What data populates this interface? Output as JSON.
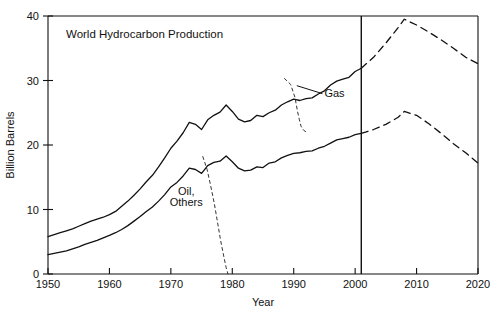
{
  "chart_data": {
    "type": "line",
    "title": "World Hydrocarbon Production",
    "xlabel": "Year",
    "ylabel": "Billion Barrels",
    "xlim": [
      1950,
      2020
    ],
    "ylim": [
      0,
      40
    ],
    "xticks": [
      1950,
      1960,
      1970,
      1980,
      1990,
      2000,
      2010,
      2020
    ],
    "xticklabels": [
      "1950",
      "1960",
      "1970",
      "1980",
      "1990",
      "2000",
      "2010",
      "2020"
    ],
    "yticks": [
      0,
      10,
      20,
      30,
      40
    ],
    "yticklabels": [
      "0",
      "10",
      "20",
      "30",
      "40"
    ],
    "grid": false,
    "legend_position": "inline-annotations",
    "annotations": [
      {
        "text": "Gas",
        "x": 1995,
        "y": 27.5,
        "leader_to": {
          "x": 1990.5,
          "y": 29.2
        }
      },
      {
        "text": "Oil,",
        "x": 1972.5,
        "y": 12.2
      },
      {
        "text": "Others",
        "x": 1972.5,
        "y": 10.5
      }
    ],
    "vertical_marker": {
      "x": 2001,
      "label": "",
      "from_y": 0,
      "to_y": 40
    },
    "series": [
      {
        "name": "Total (Oil + Gas + Others) - historical",
        "style": "solid",
        "x": [
          1950,
          1951,
          1952,
          1953,
          1954,
          1955,
          1956,
          1957,
          1958,
          1959,
          1960,
          1961,
          1962,
          1963,
          1964,
          1965,
          1966,
          1967,
          1968,
          1969,
          1970,
          1971,
          1972,
          1973,
          1974,
          1975,
          1976,
          1977,
          1978,
          1979,
          1980,
          1981,
          1982,
          1983,
          1984,
          1985,
          1986,
          1987,
          1988,
          1989,
          1990,
          1991,
          1992,
          1993,
          1994,
          1995,
          1996,
          1997,
          1998,
          1999,
          2000,
          2001
        ],
        "values": [
          5.8,
          6.1,
          6.4,
          6.7,
          7.0,
          7.4,
          7.8,
          8.2,
          8.5,
          8.8,
          9.2,
          9.7,
          10.5,
          11.3,
          12.2,
          13.2,
          14.3,
          15.3,
          16.6,
          18.0,
          19.5,
          20.6,
          21.9,
          23.5,
          23.2,
          22.4,
          23.9,
          24.6,
          25.1,
          26.2,
          25.2,
          24.0,
          23.6,
          23.8,
          24.6,
          24.4,
          25.0,
          25.4,
          26.2,
          26.7,
          27.1,
          26.9,
          27.2,
          27.3,
          27.9,
          28.4,
          29.3,
          29.9,
          30.2,
          30.5,
          31.4,
          31.9
        ]
      },
      {
        "name": "Oil - historical",
        "style": "solid",
        "x": [
          1950,
          1951,
          1952,
          1953,
          1954,
          1955,
          1956,
          1957,
          1958,
          1959,
          1960,
          1961,
          1962,
          1963,
          1964,
          1965,
          1966,
          1967,
          1968,
          1969,
          1970,
          1971,
          1972,
          1973,
          1974,
          1975,
          1976,
          1977,
          1978,
          1979,
          1980,
          1981,
          1982,
          1983,
          1984,
          1985,
          1986,
          1987,
          1988,
          1989,
          1990,
          1991,
          1992,
          1993,
          1994,
          1995,
          1996,
          1997,
          1998,
          1999,
          2000,
          2001
        ],
        "values": [
          3.0,
          3.2,
          3.4,
          3.6,
          3.9,
          4.2,
          4.6,
          4.9,
          5.2,
          5.6,
          6.0,
          6.4,
          6.9,
          7.5,
          8.2,
          8.9,
          9.7,
          10.4,
          11.3,
          12.3,
          13.5,
          14.2,
          15.2,
          16.4,
          16.2,
          15.6,
          16.8,
          17.3,
          17.5,
          18.3,
          17.4,
          16.4,
          16.0,
          16.1,
          16.6,
          16.5,
          17.2,
          17.4,
          18.0,
          18.4,
          18.7,
          18.8,
          19.0,
          19.1,
          19.5,
          19.8,
          20.3,
          20.8,
          21.0,
          21.2,
          21.6,
          21.8
        ]
      },
      {
        "name": "Total - projected",
        "style": "dashed",
        "x": [
          2001,
          2003,
          2005,
          2007,
          2008,
          2010,
          2012,
          2014,
          2016,
          2018,
          2020
        ],
        "values": [
          31.9,
          33.6,
          35.8,
          38.2,
          39.5,
          38.6,
          37.5,
          36.3,
          35.0,
          33.6,
          32.6
        ]
      },
      {
        "name": "Oil - projected",
        "style": "dashed",
        "x": [
          2001,
          2003,
          2005,
          2007,
          2008,
          2010,
          2012,
          2014,
          2016,
          2018,
          2020
        ],
        "values": [
          21.8,
          22.4,
          23.2,
          24.3,
          25.2,
          24.6,
          23.3,
          21.8,
          20.2,
          18.8,
          17.2
        ]
      },
      {
        "name": "Gas (difference indicator)",
        "style": "dashed-thin",
        "x": [
          1988.5,
          1989.5,
          1990.2,
          1990.6,
          1990.9,
          1991.2,
          1991.6,
          1992.2
        ],
        "values": [
          30.3,
          29.4,
          27.4,
          25.3,
          24.0,
          22.9,
          22.3,
          21.9
        ]
      },
      {
        "name": "Oil, Others (difference indicator)",
        "style": "dashed-thin",
        "x": [
          1975.2,
          1975.9,
          1976.5,
          1977.1,
          1977.6,
          1978.1,
          1978.6,
          1979.0,
          1979.3
        ],
        "values": [
          18.2,
          16.2,
          13.6,
          10.8,
          8.0,
          5.2,
          2.8,
          1.0,
          0.0
        ]
      }
    ]
  }
}
